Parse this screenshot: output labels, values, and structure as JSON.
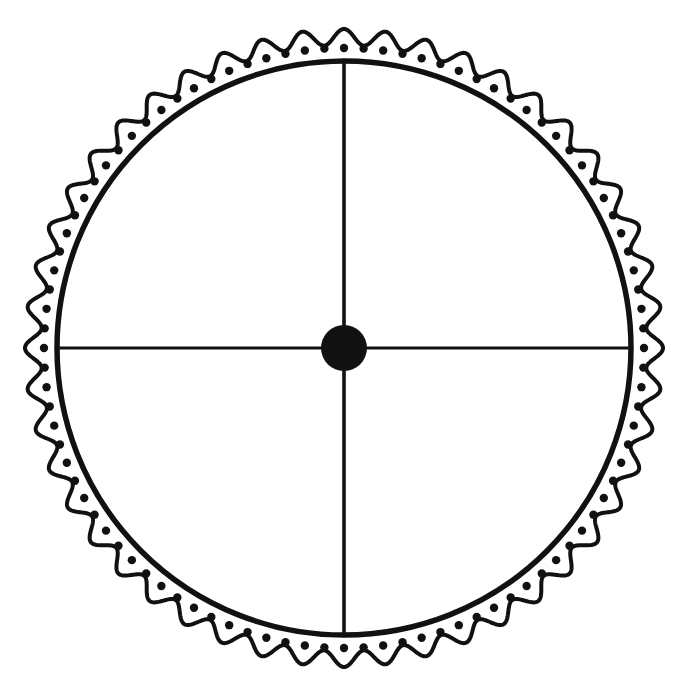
{
  "document": {
    "title": "Wheel Diagram",
    "background_color": "#ffffff",
    "ink_color": "#111111",
    "width": 695,
    "height": 692
  },
  "figure": {
    "name": "spoked-wheel-with-scalloped-rim",
    "center": {
      "x": 344,
      "y": 348
    },
    "parts": [
      {
        "name": "scalloped-outer-border",
        "label": "Scalloped outer border",
        "shape": "wavy-circle",
        "base_radius": 311,
        "amplitude": 8,
        "lobes": 48,
        "stroke_width": 4,
        "stroke_color": "#111111",
        "fill": "none"
      },
      {
        "name": "dot-ring",
        "label": "Ring of dots",
        "shape": "dot-ring",
        "radius": 300,
        "count": 96,
        "dot_radius": 4.2,
        "fill": "#111111",
        "start_angle_deg": -90
      },
      {
        "name": "inner-circle",
        "label": "Inner circle",
        "shape": "circle",
        "radius": 287,
        "stroke_width": 5.5,
        "stroke_color": "#111111",
        "fill": "none"
      },
      {
        "name": "vertical-spoke",
        "label": "Vertical spoke",
        "shape": "line",
        "x1": 344,
        "y1": 61,
        "x2": 344,
        "y2": 635,
        "stroke_width": 3.6,
        "stroke_color": "#111111"
      },
      {
        "name": "horizontal-spoke",
        "label": "Horizontal spoke",
        "shape": "line",
        "x1": 57,
        "y1": 348,
        "x2": 631,
        "y2": 348,
        "stroke_width": 3.2,
        "stroke_color": "#111111"
      },
      {
        "name": "center-hub",
        "label": "Center hub",
        "shape": "circle",
        "radius": 23,
        "fill": "#111111",
        "stroke_width": 0
      }
    ]
  }
}
